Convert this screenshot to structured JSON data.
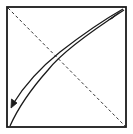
{
  "diagram": {
    "type": "origami-fold-instruction",
    "colors": {
      "background": "#ffffff",
      "stroke": "#1a1a1a",
      "dashed": "#333333"
    },
    "elements": [
      {
        "name": "paper-square",
        "shape": "rect",
        "x": 7,
        "y": 7,
        "w": 119,
        "h": 120
      },
      {
        "name": "dashed-fold-line",
        "shape": "line",
        "from": [
          8,
          8
        ],
        "to": [
          125,
          126
        ],
        "style": "dashed"
      },
      {
        "name": "fold-edge-curve",
        "shape": "curve",
        "from": [
          124,
          10
        ],
        "to": [
          10,
          126
        ],
        "style": "solid"
      },
      {
        "name": "fold-arrow",
        "shape": "curved-arrow",
        "from": [
          122,
          10
        ],
        "to": [
          11,
          107
        ],
        "style": "solid"
      }
    ]
  }
}
